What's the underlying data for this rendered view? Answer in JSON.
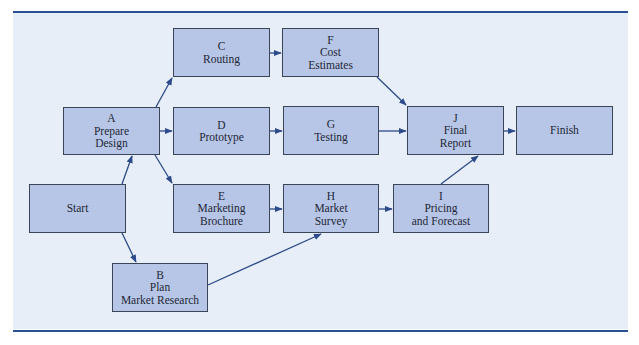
{
  "figure": {
    "colors": {
      "rule": "#2a4f94",
      "panel": "#e7eef8",
      "node_fill": "#b7c6e6",
      "node_border": "#3a4558",
      "edge": "#2d4a8a"
    }
  },
  "nodes": [
    {
      "id": "start",
      "letter": "",
      "lines": [
        "Start"
      ],
      "x": 29,
      "y": 184,
      "w": 97,
      "h": 49
    },
    {
      "id": "A",
      "letter": "A",
      "lines": [
        "Prepare",
        "Design"
      ],
      "x": 63,
      "y": 107,
      "w": 97,
      "h": 48
    },
    {
      "id": "B",
      "letter": "B",
      "lines": [
        "Plan",
        "Market Research"
      ],
      "x": 112,
      "y": 263,
      "w": 96,
      "h": 49
    },
    {
      "id": "C",
      "letter": "C",
      "lines": [
        "Routing"
      ],
      "x": 173,
      "y": 28,
      "w": 97,
      "h": 49
    },
    {
      "id": "D",
      "letter": "D",
      "lines": [
        "Prototype"
      ],
      "x": 173,
      "y": 107,
      "w": 97,
      "h": 48
    },
    {
      "id": "E",
      "letter": "E",
      "lines": [
        "Marketing",
        "Brochure"
      ],
      "x": 173,
      "y": 184,
      "w": 97,
      "h": 49
    },
    {
      "id": "F",
      "letter": "F",
      "lines": [
        "Cost",
        "Estimates"
      ],
      "x": 282,
      "y": 28,
      "w": 97,
      "h": 49
    },
    {
      "id": "G",
      "letter": "G",
      "lines": [
        "Testing"
      ],
      "x": 283,
      "y": 106,
      "w": 96,
      "h": 49
    },
    {
      "id": "H",
      "letter": "H",
      "lines": [
        "Market",
        "Survey"
      ],
      "x": 283,
      "y": 184,
      "w": 96,
      "h": 49
    },
    {
      "id": "I",
      "letter": "I",
      "lines": [
        "Pricing",
        "and Forecast"
      ],
      "x": 393,
      "y": 184,
      "w": 96,
      "h": 49
    },
    {
      "id": "J",
      "letter": "J",
      "lines": [
        "Final",
        "Report"
      ],
      "x": 407,
      "y": 106,
      "w": 97,
      "h": 49
    },
    {
      "id": "finish",
      "letter": "",
      "lines": [
        "Finish"
      ],
      "x": 516,
      "y": 106,
      "w": 97,
      "h": 49
    }
  ],
  "edges": [
    {
      "from": "start",
      "to": "A",
      "x1": 122,
      "y1": 184,
      "x2": 132,
      "y2": 156
    },
    {
      "from": "start",
      "to": "B",
      "x1": 122,
      "y1": 233,
      "x2": 136,
      "y2": 262
    },
    {
      "from": "A",
      "to": "C",
      "x1": 156,
      "y1": 107,
      "x2": 172,
      "y2": 78
    },
    {
      "from": "A",
      "to": "D",
      "x1": 160,
      "y1": 131,
      "x2": 172,
      "y2": 131
    },
    {
      "from": "A",
      "to": "E",
      "x1": 155,
      "y1": 155,
      "x2": 172,
      "y2": 183
    },
    {
      "from": "B",
      "to": "H",
      "x1": 208,
      "y1": 285,
      "x2": 321,
      "y2": 234
    },
    {
      "from": "C",
      "to": "F",
      "x1": 270,
      "y1": 53,
      "x2": 281,
      "y2": 53
    },
    {
      "from": "D",
      "to": "G",
      "x1": 270,
      "y1": 131,
      "x2": 282,
      "y2": 131
    },
    {
      "from": "E",
      "to": "H",
      "x1": 270,
      "y1": 209,
      "x2": 282,
      "y2": 209
    },
    {
      "from": "F",
      "to": "J",
      "x1": 377,
      "y1": 77,
      "x2": 406,
      "y2": 105
    },
    {
      "from": "G",
      "to": "J",
      "x1": 379,
      "y1": 131,
      "x2": 406,
      "y2": 131
    },
    {
      "from": "H",
      "to": "I",
      "x1": 379,
      "y1": 209,
      "x2": 392,
      "y2": 209
    },
    {
      "from": "I",
      "to": "J",
      "x1": 441,
      "y1": 184,
      "x2": 478,
      "y2": 156
    },
    {
      "from": "J",
      "to": "finish",
      "x1": 504,
      "y1": 131,
      "x2": 515,
      "y2": 131
    }
  ]
}
